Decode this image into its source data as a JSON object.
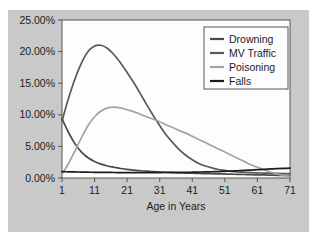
{
  "chart_data": {
    "type": "line",
    "title": "",
    "xlabel": "Age in Years",
    "ylabel": "",
    "xlim": [
      1,
      71
    ],
    "ylim": [
      0,
      25
    ],
    "grid": false,
    "legend_position": "top-right",
    "x_tick_labels": [
      "1",
      "11",
      "21",
      "31",
      "41",
      "51",
      "61",
      "71"
    ],
    "x_ticks": [
      1,
      11,
      21,
      31,
      41,
      51,
      61,
      71
    ],
    "y_tick_labels": [
      "0.00%",
      "5.00%",
      "10.00%",
      "15.00%",
      "20.00%",
      "25.00%"
    ],
    "y_ticks": [
      0,
      5,
      10,
      15,
      20,
      25
    ],
    "x": [
      1,
      3,
      5,
      7,
      9,
      11,
      13,
      15,
      17,
      19,
      21,
      23,
      25,
      27,
      29,
      31,
      33,
      35,
      37,
      39,
      41,
      43,
      45,
      47,
      49,
      51,
      53,
      55,
      57,
      59,
      61,
      63,
      65,
      67,
      69,
      71
    ],
    "series": [
      {
        "name": "Drowning",
        "color": "#4a4a4a",
        "values": [
          9.4,
          7.2,
          5.4,
          4.1,
          3.2,
          2.6,
          2.2,
          1.9,
          1.7,
          1.5,
          1.35,
          1.25,
          1.15,
          1.08,
          1.0,
          0.95,
          0.9,
          0.85,
          0.8,
          0.78,
          0.75,
          0.72,
          0.7,
          0.68,
          0.65,
          0.62,
          0.6,
          0.58,
          0.55,
          0.52,
          0.5,
          0.48,
          0.45,
          0.42,
          0.4,
          0.38
        ]
      },
      {
        "name": "MV Traffic",
        "color": "#595959",
        "values": [
          9.0,
          12.6,
          15.7,
          18.2,
          20.0,
          20.9,
          21.0,
          20.5,
          19.5,
          18.2,
          16.7,
          15.1,
          13.4,
          11.6,
          9.9,
          8.3,
          6.8,
          5.6,
          4.5,
          3.6,
          2.9,
          2.3,
          1.9,
          1.6,
          1.35,
          1.2,
          1.05,
          0.95,
          0.9,
          0.85,
          0.8,
          0.78,
          0.75,
          0.72,
          0.7,
          0.68
        ]
      },
      {
        "name": "Poisoning",
        "color": "#a3a3a3",
        "values": [
          0.6,
          2.3,
          4.3,
          6.4,
          8.3,
          9.7,
          10.6,
          11.1,
          11.2,
          11.1,
          10.8,
          10.5,
          10.1,
          9.7,
          9.3,
          8.9,
          8.4,
          8.0,
          7.5,
          7.1,
          6.6,
          6.1,
          5.6,
          5.1,
          4.6,
          4.1,
          3.6,
          3.1,
          2.6,
          2.1,
          1.7,
          1.3,
          0.95,
          0.65,
          0.4,
          0.25
        ]
      },
      {
        "name": "Falls",
        "color": "#1c1c1c",
        "values": [
          1.0,
          0.98,
          0.96,
          0.94,
          0.92,
          0.9,
          0.89,
          0.88,
          0.87,
          0.86,
          0.85,
          0.85,
          0.85,
          0.85,
          0.86,
          0.86,
          0.87,
          0.88,
          0.89,
          0.9,
          0.92,
          0.94,
          0.96,
          0.99,
          1.02,
          1.06,
          1.1,
          1.15,
          1.2,
          1.26,
          1.32,
          1.38,
          1.43,
          1.48,
          1.52,
          1.55
        ]
      }
    ]
  }
}
